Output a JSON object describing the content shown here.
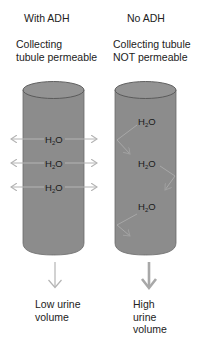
{
  "top_caption_fragment": "...",
  "columns": [
    {
      "heading": "With ADH",
      "description": "Collecting\ntubule permeable",
      "molecules": [
        "H2O",
        "H2O",
        "H2O"
      ],
      "water_movement": "outward-through-wall",
      "result": "Low urine\nvolume"
    },
    {
      "heading": "No ADH",
      "description": "Collecting tubule\nNOT permeable",
      "molecules": [
        "H2O",
        "H2O",
        "H2O"
      ],
      "water_movement": "reflected-by-wall",
      "result": "High\nurine\nvolume"
    }
  ],
  "molecule_label": {
    "main": "H",
    "sub": "2",
    "tail": "O"
  },
  "colors": {
    "tubule_fill": "#8c8c8c",
    "tubule_top": "#969696",
    "tubule_outline": "#5a5a5a",
    "arrow": "#b4b4b4",
    "bounce_arrow": "#a8a8a8",
    "text": "#222222"
  },
  "icons": {
    "water_out_arrow": "double-headed-horizontal-arrow",
    "water_bounce_arrow": "reflected-arrow",
    "urine_flow_arrow": "down-arrow"
  }
}
